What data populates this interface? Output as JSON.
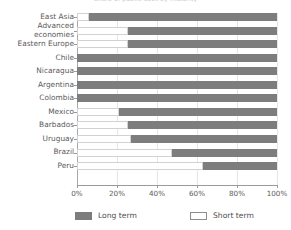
{
  "chart_data": {
    "type": "bar",
    "orientation": "horizontal",
    "stacked": true,
    "normalized_percent": true,
    "title": "Share of public debt by maturity",
    "xlabel": "",
    "ylabel": "",
    "xlim": [
      0,
      100
    ],
    "xticks": [
      "0%",
      "20%",
      "40%",
      "60%",
      "80%",
      "100%"
    ],
    "xtick_values": [
      0,
      20,
      40,
      60,
      80,
      100
    ],
    "grid": "vertical",
    "legend_position": "bottom",
    "categories": [
      "East Asia",
      "Advanced\neconomies",
      "Eastern Europe",
      "Chile",
      "Nicaragua",
      "Argentina",
      "Colombia",
      "Mexico",
      "Barbados",
      "Uruguay",
      "Brazil",
      "Peru"
    ],
    "series": [
      {
        "name": "Short term",
        "color": "#ffffff",
        "values": [
          6,
          25.5,
          25.5,
          0,
          0,
          0,
          0,
          21,
          25.5,
          27,
          47.5,
          63
        ]
      },
      {
        "name": "Long term",
        "color": "#7d7d7d",
        "values": [
          94,
          74.5,
          74.5,
          100,
          100,
          100,
          100,
          79,
          74.5,
          73,
          52.5,
          37
        ]
      }
    ]
  },
  "legend": {
    "items": [
      {
        "label": "Long term",
        "swatch": "long"
      },
      {
        "label": "Short term",
        "swatch": "short"
      }
    ]
  },
  "colors": {
    "long_term": "#7d7d7d",
    "short_term": "#ffffff",
    "gridline": "#e6e6e6",
    "axis": "#9a9a9a",
    "text": "#5b5b5b",
    "background": "#ffffff"
  }
}
